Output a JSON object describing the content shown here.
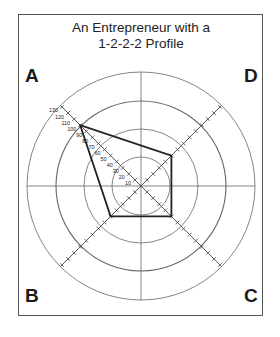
{
  "chart_data": {
    "type": "radar",
    "title": "An Entrepreneur with a 1-2-2-2 Profile",
    "title_lines": [
      "An Entrepreneur with a",
      "1-2-2-2 Profile"
    ],
    "quadrant_labels": [
      "A",
      "B",
      "C",
      "D"
    ],
    "axes": [
      {
        "name": "A",
        "direction": "upper-left",
        "value": 100
      },
      {
        "name": "B",
        "direction": "lower-left",
        "value": 50
      },
      {
        "name": "C",
        "direction": "lower-right",
        "value": 50
      },
      {
        "name": "D",
        "direction": "upper-right",
        "value": 50
      }
    ],
    "series": [
      {
        "name": "1-2-2-2 Profile",
        "values": {
          "A": 100,
          "B": 50,
          "C": 50,
          "D": 50
        }
      }
    ],
    "tick_labels": [
      "10",
      "20",
      "30",
      "40",
      "50",
      "60",
      "70",
      "80",
      "90",
      "100",
      "110",
      "120",
      "130"
    ],
    "tick_step": 10,
    "axis_range": [
      0,
      130
    ],
    "rings": 4,
    "grid": true,
    "legend": "none"
  },
  "geometry": {
    "cx": 141,
    "cy": 186,
    "px_per_unit": 0.86,
    "ring_radii": [
      29,
      57,
      85,
      114
    ],
    "axis_max_units": 132
  }
}
